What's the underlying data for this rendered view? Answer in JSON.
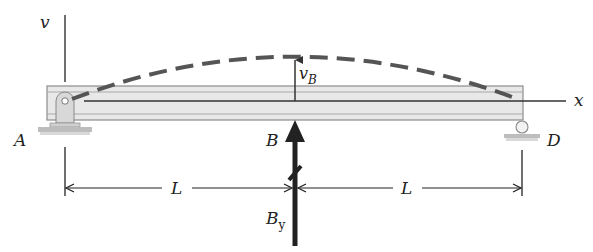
{
  "diagram": {
    "type": "beam-deflection",
    "axes": {
      "vertical_label": "v",
      "horizontal_label": "x"
    },
    "points": {
      "A": "A",
      "B": "B",
      "D": "D"
    },
    "deflection_label": "v",
    "deflection_subscript": "B",
    "reaction_label": "B",
    "reaction_subscript": "y",
    "dimensions": [
      {
        "label": "L",
        "from": "A",
        "to": "B"
      },
      {
        "label": "L",
        "from": "B",
        "to": "D"
      }
    ],
    "supports": {
      "A": "pin",
      "D": "roller"
    },
    "colors": {
      "beam_fill": "#e6e6e6",
      "beam_stroke": "#8c8c8c",
      "curve": "#555555",
      "line": "#222222"
    }
  }
}
